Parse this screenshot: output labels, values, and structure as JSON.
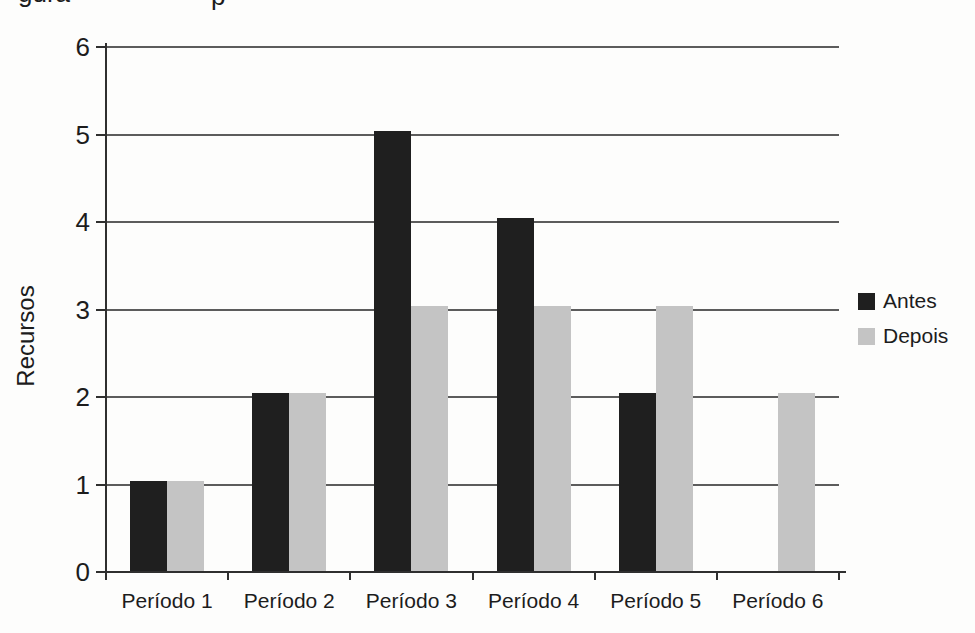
{
  "page": {
    "background": "#fdfdfc",
    "header_fragments": {
      "left": "gura",
      "right": "p"
    }
  },
  "chart_data": {
    "type": "bar",
    "title": "",
    "categories": [
      "Período 1",
      "Período 2",
      "Período 3",
      "Período 4",
      "Período 5",
      "Período 6"
    ],
    "series": [
      {
        "name": "Antes",
        "color": "#1f1f1f",
        "values": [
          1,
          2,
          5,
          4,
          2,
          0
        ]
      },
      {
        "name": "Depois",
        "color": "#c4c4c4",
        "values": [
          1,
          2,
          3,
          3,
          3,
          2
        ]
      }
    ],
    "xlabel": "",
    "ylabel": "Recursos",
    "ylim": [
      0,
      6
    ],
    "yticks": [
      0,
      1,
      2,
      3,
      4,
      5,
      6
    ],
    "grid": true,
    "legend_position": "right",
    "colors": {
      "axis": "#2f2f2f",
      "grid": "#5c5c5c",
      "text": "#1c1c1c"
    }
  }
}
